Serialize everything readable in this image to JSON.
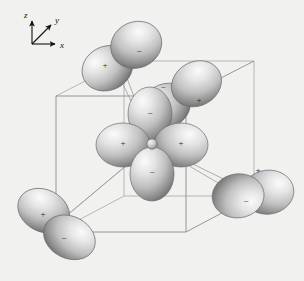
{
  "figure": {
    "background_color": "#f1f1ef",
    "width": 304,
    "height": 281
  },
  "axes": {
    "name": "axis-triad",
    "origin": {
      "x": 32,
      "y": 44
    },
    "labels": [
      {
        "id": "z",
        "text": "z",
        "x": 26,
        "y": 17
      },
      {
        "id": "y",
        "text": "y",
        "x": 57,
        "y": 22
      },
      {
        "id": "x",
        "text": "x",
        "x": 62,
        "y": 47
      }
    ],
    "arrows": [
      {
        "id": "z-axis-arrow",
        "x1": 32,
        "y1": 44,
        "x2": 32,
        "y2": 20
      },
      {
        "id": "y-axis-arrow",
        "x1": 32,
        "y1": 44,
        "x2": 52,
        "y2": 24
      },
      {
        "id": "x-axis-arrow",
        "x1": 32,
        "y1": 44,
        "x2": 57,
        "y2": 44
      }
    ]
  },
  "unit_cell": {
    "name": "unit-cell-cube",
    "front_face": [
      {
        "x": 56,
        "y": 96
      },
      {
        "x": 186,
        "y": 96
      },
      {
        "x": 186,
        "y": 232
      },
      {
        "x": 56,
        "y": 232
      }
    ],
    "back_face": [
      {
        "x": 124,
        "y": 61
      },
      {
        "x": 254,
        "y": 61
      },
      {
        "x": 254,
        "y": 196
      },
      {
        "x": 124,
        "y": 196
      }
    ]
  },
  "center_atom": {
    "name": "central-atom",
    "x": 152,
    "y": 144,
    "radius": 5.2
  },
  "orbitals": [
    {
      "id": "top-left-pair",
      "position": {
        "x": 110,
        "y": 62
      },
      "rotation": -28,
      "lobe_length": 29,
      "lobe_width": 21,
      "positive": {
        "sign": "+",
        "side": "lower-left"
      },
      "negative": {
        "sign": "−",
        "side": "upper-right"
      }
    },
    {
      "id": "upper-mid-pair",
      "position": {
        "x": 178,
        "y": 96
      },
      "rotation": -32,
      "lobe_length": 28,
      "lobe_width": 21,
      "positive": {
        "sign": "+",
        "side": "lower-right"
      },
      "negative": {
        "sign": "−",
        "side": "upper-left"
      }
    },
    {
      "id": "center-horizontal-pair",
      "position": {
        "x": 152,
        "y": 144
      },
      "rotation": 0,
      "lobe_length": 28,
      "lobe_width": 22,
      "positive": {
        "sign": "+",
        "side": "left"
      },
      "negative": {
        "sign": "+",
        "side": "right"
      }
    },
    {
      "id": "center-vertical-pair",
      "position": {
        "x": 152,
        "y": 144
      },
      "rotation": 90,
      "lobe_length": 28,
      "lobe_width": 22,
      "positive": {
        "sign": "−",
        "side": "top"
      },
      "negative": {
        "sign": "−",
        "side": "bottom"
      }
    },
    {
      "id": "bottom-left-pair",
      "position": {
        "x": 57,
        "y": 222
      },
      "rotation": 27,
      "lobe_length": 29,
      "lobe_width": 22,
      "positive": {
        "sign": "+",
        "side": "upper-left"
      },
      "negative": {
        "sign": "−",
        "side": "lower-right"
      }
    },
    {
      "id": "bottom-right-pair",
      "position": {
        "x": 253,
        "y": 194
      },
      "rotation": 83,
      "lobe_length": 27,
      "lobe_width": 23,
      "positive": {
        "sign": "+",
        "side": "top"
      },
      "negative": {
        "sign": "−",
        "side": "bottom"
      }
    }
  ],
  "signs": {
    "plus": "+",
    "minus": "−"
  },
  "colors": {
    "background": "#f1f1ef",
    "lobe_light": "#f4f4f4",
    "lobe_mid": "#c3c3c3",
    "lobe_dark": "#7d7d7d",
    "edge": "#8c8c8c",
    "edge_back": "#a8a8a8",
    "text": "#111111"
  },
  "sign_markers": [
    {
      "id": "sign-top-left-plus",
      "text": "+",
      "x": 105,
      "y": 66
    },
    {
      "id": "sign-top-left-minus",
      "text": "−",
      "x": 139,
      "y": 52
    },
    {
      "id": "sign-upper-mid-minus",
      "text": "−",
      "x": 163,
      "y": 88
    },
    {
      "id": "sign-upper-mid-plus",
      "text": "+",
      "x": 199,
      "y": 101
    },
    {
      "id": "sign-inner-minus",
      "text": "−",
      "x": 150,
      "y": 114
    },
    {
      "id": "sign-center-left-plus",
      "text": "+",
      "x": 123,
      "y": 144
    },
    {
      "id": "sign-center-right-plus",
      "text": "+",
      "x": 181,
      "y": 144
    },
    {
      "id": "sign-center-bottom-minus",
      "text": "−",
      "x": 152,
      "y": 173
    },
    {
      "id": "sign-bottom-left-plus",
      "text": "+",
      "x": 43,
      "y": 215
    },
    {
      "id": "sign-bottom-left-minus",
      "text": "−",
      "x": 64,
      "y": 239
    },
    {
      "id": "sign-bottom-right-plus",
      "text": "+",
      "x": 258,
      "y": 171
    },
    {
      "id": "sign-bottom-right-minus",
      "text": "−",
      "x": 246,
      "y": 202
    }
  ]
}
